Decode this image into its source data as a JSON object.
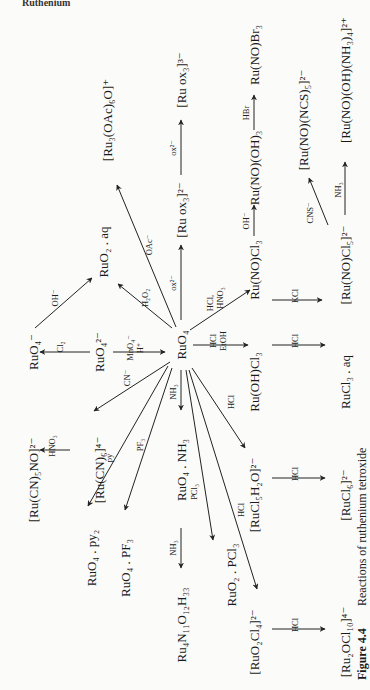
{
  "header_fragment": "Ruthenium",
  "caption": {
    "figure_label": "Figure 4.4",
    "text": "Reactions of ruthenium tetroxide"
  },
  "orientation": "rotated 90 degrees counter-clockwise (text reads bottom to top)",
  "center": {
    "id": "RuO4",
    "label": "RuO₄"
  },
  "nodes": [
    {
      "id": "RuO4",
      "label": "RuO₄"
    },
    {
      "id": "RuO4_minus",
      "label": "RuO₄⁻"
    },
    {
      "id": "RuO4_2minus",
      "label": "RuO₄²⁻"
    },
    {
      "id": "RuO2_aq",
      "label": "RuO₂ . aq"
    },
    {
      "id": "Ru3OAc",
      "label": "[Ru₃(OAc)₆O]⁺"
    },
    {
      "id": "Ruox3_3",
      "label": "[Ru ox₃]³⁻"
    },
    {
      "id": "Ruox3_2",
      "label": "[Ru ox₃]²⁻"
    },
    {
      "id": "RuNOOH3",
      "label": "Ru(NO)(OH)₃"
    },
    {
      "id": "RuNOBr3",
      "label": "Ru(NO)Br₃"
    },
    {
      "id": "RuNONCS5",
      "label": "[Ru(NO)(NCS)₅]²⁻"
    },
    {
      "id": "RuNOOHNH34",
      "label": "[Ru(NO)(OH)(NH₃)₄]²⁺"
    },
    {
      "id": "RuNOCl3",
      "label": "Ru(NO)Cl₃"
    },
    {
      "id": "RuNOCl5",
      "label": "[Ru(NO)Cl₅]²⁻"
    },
    {
      "id": "RuOHCl3",
      "label": "Ru(OH)Cl₃"
    },
    {
      "id": "RuCl3aq",
      "label": "RuCl₃ . aq"
    },
    {
      "id": "RuCN5NO",
      "label": "[Ru(CN)₅NO]²⁻"
    },
    {
      "id": "RuCN6",
      "label": "[Ru(CN)₆]⁴⁻"
    },
    {
      "id": "RuO4py2",
      "label": "RuO₄ . py₂"
    },
    {
      "id": "RuO4PF3",
      "label": "RuO₄ . PF₃"
    },
    {
      "id": "RuO4NH3",
      "label": "RuO₄ . NH₃"
    },
    {
      "id": "Ru4N11",
      "label": "Ru₄N₁₁O₁₂H₃₃"
    },
    {
      "id": "RuO2PCl3",
      "label": "RuO₂ . PCl₃"
    },
    {
      "id": "RuCl5H2O",
      "label": "[RuCl₅H₂O]²⁻"
    },
    {
      "id": "RuCl6",
      "label": "[RuCl₆]²⁻"
    },
    {
      "id": "RuO2Cl4",
      "label": "[RuO₂Cl₄]²⁻"
    },
    {
      "id": "Ru2OCl10",
      "label": "[Ru₂OCl₁₀]⁴⁻"
    }
  ],
  "edges": [
    {
      "from": "RuO4_2minus",
      "to": "RuO4_minus",
      "reagent": "Cl₂"
    },
    {
      "from": "RuO4_minus",
      "to": "RuO2_aq",
      "reagent": "OH⁻"
    },
    {
      "from": "RuO4_2minus",
      "to": "RuO4",
      "reagent": "MnO₄⁻ / H⁺"
    },
    {
      "from": "RuO4",
      "to": "RuO2_aq",
      "reagent": "H₂O₂"
    },
    {
      "from": "RuO4",
      "to": "Ru3OAc",
      "reagent": "OAc⁻"
    },
    {
      "from": "RuO4",
      "to": "Ruox3_2",
      "reagent": "ox²⁻"
    },
    {
      "from": "Ruox3_2",
      "to": "Ruox3_3",
      "reagent": "ox²⁻"
    },
    {
      "from": "RuO4",
      "to": "RuNOCl3",
      "reagent": "HCl, HNO₃"
    },
    {
      "from": "RuNOCl3",
      "to": "RuNOOH3",
      "reagent": "OH⁻"
    },
    {
      "from": "RuNOOH3",
      "to": "RuNOBr3",
      "reagent": "HBr"
    },
    {
      "from": "RuNOCl3",
      "to": "RuNOCl5",
      "reagent": "KCl"
    },
    {
      "from": "RuNOCl5",
      "to": "RuNONCS5",
      "reagent": "CNS⁻"
    },
    {
      "from": "RuNOCl5",
      "to": "RuNOOHNH34",
      "reagent": "NH₃"
    },
    {
      "from": "RuO4",
      "to": "RuOHCl3",
      "reagent": "HCl / EtOH"
    },
    {
      "from": "RuOHCl3",
      "to": "RuCl3aq",
      "reagent": "HCl"
    },
    {
      "from": "RuO4",
      "to": "RuCN6",
      "reagent": "CN⁻"
    },
    {
      "from": "RuCN6",
      "to": "RuCN5NO",
      "reagent": "HNO₃"
    },
    {
      "from": "RuO4",
      "to": "RuO4py2",
      "reagent": "py"
    },
    {
      "from": "RuO4",
      "to": "RuO4PF3",
      "reagent": "PF₃"
    },
    {
      "from": "RuO4",
      "to": "RuO4NH3",
      "reagent": "NH₃"
    },
    {
      "from": "RuO4NH3",
      "to": "Ru4N11",
      "reagent": "NH₃"
    },
    {
      "from": "RuO4",
      "to": "RuO2PCl3",
      "reagent": "PCl₃"
    },
    {
      "from": "RuO4",
      "to": "RuCl5H2O",
      "reagent": "HCl"
    },
    {
      "from": "RuCl5H2O",
      "to": "RuCl6",
      "reagent": "HCl"
    },
    {
      "from": "RuO4",
      "to": "RuO2Cl4",
      "reagent": "HCl"
    },
    {
      "from": "RuO2Cl4",
      "to": "Ru2OCl10",
      "reagent": "HCl"
    }
  ],
  "labels": {
    "RuO4": "RuO₄",
    "RuO4_minus": "RuO₄⁻",
    "RuO4_2minus": "RuO₄²⁻",
    "RuO2_aq": "RuO₂ . aq",
    "Ru3OAc": "[Ru₃(OAc)₆O]⁺",
    "Ruox3_3": "[Ru ox₃]³⁻",
    "Ruox3_2": "[Ru ox₃]²⁻",
    "RuNOOH3": "Ru(NO)(OH)₃",
    "RuNOBr3": "Ru(NO)Br₃",
    "RuNONCS5": "[Ru(NO)(NCS)₅]²⁻",
    "RuNOOHNH34": "[Ru(NO)(OH)(NH₃)₄]²⁺",
    "RuNOCl3": "Ru(NO)Cl₃",
    "RuNOCl5": "[Ru(NO)Cl₅]²⁻",
    "RuOHCl3": "Ru(OH)Cl₃",
    "RuCl3aq": "RuCl₃ . aq",
    "RuCN5NO": "[Ru(CN)₅NO]²⁻",
    "RuCN6": "[Ru(CN)₆]⁴⁻",
    "RuO4py2": "RuO₄ . py₂",
    "RuO4PF3": "RuO₄ . PF₃",
    "RuO4NH3": "RuO₄ . NH₃",
    "Ru4N11": "Ru₄N₁₁O₁₂H₃₃",
    "RuO2PCl3": "RuO₂ . PCl₃",
    "RuCl5H2O": "[RuCl₅H₂O]²⁻",
    "RuCl6": "[RuCl₆]²⁻",
    "RuO2Cl4": "[RuO₂Cl₄]²⁻",
    "Ru2OCl10": "[Ru₂OCl₁₀]⁴⁻"
  },
  "reagents": {
    "Cl2": "Cl₂",
    "OH_a": "OH⁻",
    "MnO4": "MnO₄⁻",
    "Hplus": "H⁺",
    "H2O2": "H₂O₂",
    "OAc": "OAc⁻",
    "ox_a": "ox²⁻",
    "ox_b": "ox²⁻",
    "HCl_c": "HCl,",
    "HNO3_c": "HNO₃",
    "OH_b": "OH⁻",
    "HBr": "HBr",
    "KCl": "KCl",
    "CNS": "CNS⁻",
    "NH3_c": "NH₃",
    "HCl_e": "HCl",
    "EtOH": "EtOH",
    "HCl_f": "HCl",
    "CN": "CN⁻",
    "HNO3_d": "HNO₃",
    "py": "py",
    "PF3": "PF₃",
    "NH3_a": "NH₃",
    "NH3_b": "NH₃",
    "PCl3": "PCl₃",
    "HCl_g": "HCl",
    "HCl_h": "HCl",
    "HCl_i": "HCl",
    "HCl_j": "HCl"
  }
}
